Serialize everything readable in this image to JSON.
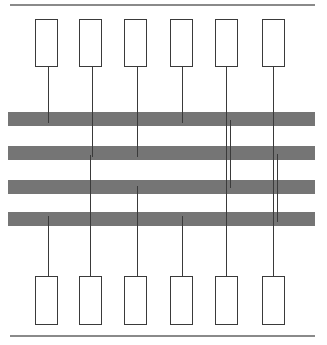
{
  "figure": {
    "title": "",
    "canvas": {
      "width": 327,
      "height": 345,
      "background": "#ffffff"
    },
    "colors": {
      "band": "#757575",
      "rule": "#8a8a8a",
      "box_stroke": "#3a3a3a",
      "line": "#3a3a3a",
      "background": "#ffffff"
    },
    "rules": [
      {
        "name": "top-rule",
        "x": 10,
        "y": 4,
        "width": 305,
        "height": 1.6
      },
      {
        "name": "bottom-rule",
        "x": 10,
        "y": 335,
        "width": 305,
        "height": 1.6
      }
    ],
    "bands": [
      {
        "name": "band-1",
        "index": 1,
        "x": 8,
        "y": 112,
        "width": 307,
        "height": 14
      },
      {
        "name": "band-2",
        "index": 2,
        "x": 8,
        "y": 146,
        "width": 307,
        "height": 14
      },
      {
        "name": "band-3",
        "index": 3,
        "x": 8,
        "y": 180,
        "width": 307,
        "height": 14
      },
      {
        "name": "band-4",
        "index": 4,
        "x": 8,
        "y": 212,
        "width": 307,
        "height": 14
      }
    ],
    "top_boxes": [
      {
        "name": "top-box-1",
        "index": 1,
        "label": "",
        "x": 35,
        "y": 19,
        "width": 23,
        "height": 48
      },
      {
        "name": "top-box-2",
        "index": 2,
        "label": "",
        "x": 79,
        "y": 19,
        "width": 23,
        "height": 48
      },
      {
        "name": "top-box-3",
        "index": 3,
        "label": "",
        "x": 124,
        "y": 19,
        "width": 23,
        "height": 48
      },
      {
        "name": "top-box-4",
        "index": 4,
        "label": "",
        "x": 170,
        "y": 19,
        "width": 23,
        "height": 48
      },
      {
        "name": "top-box-5",
        "index": 5,
        "label": "",
        "x": 215,
        "y": 19,
        "width": 23,
        "height": 48
      },
      {
        "name": "top-box-6",
        "index": 6,
        "label": "",
        "x": 262,
        "y": 19,
        "width": 23,
        "height": 48
      }
    ],
    "bottom_boxes": [
      {
        "name": "bottom-box-1",
        "index": 1,
        "label": "",
        "x": 35,
        "y": 276,
        "width": 23,
        "height": 49
      },
      {
        "name": "bottom-box-2",
        "index": 2,
        "label": "",
        "x": 79,
        "y": 276,
        "width": 23,
        "height": 49
      },
      {
        "name": "bottom-box-3",
        "index": 3,
        "label": "",
        "x": 124,
        "y": 276,
        "width": 23,
        "height": 49
      },
      {
        "name": "bottom-box-4",
        "index": 4,
        "label": "",
        "x": 170,
        "y": 276,
        "width": 23,
        "height": 49
      },
      {
        "name": "bottom-box-5",
        "index": 5,
        "label": "",
        "x": 215,
        "y": 276,
        "width": 23,
        "height": 49
      },
      {
        "name": "bottom-box-6",
        "index": 6,
        "label": "",
        "x": 262,
        "y": 276,
        "width": 23,
        "height": 49
      }
    ],
    "links": [
      {
        "name": "link-top-1",
        "column": 1,
        "x": 48,
        "y": 67,
        "height": 56
      },
      {
        "name": "link-bottom-1",
        "column": 1,
        "x": 48,
        "y": 216,
        "height": 60
      },
      {
        "name": "link-top-2",
        "column": 2,
        "x": 92,
        "y": 67,
        "height": 90
      },
      {
        "name": "link-stub-2",
        "column": 2,
        "x": 90,
        "y": 155,
        "height": 33
      },
      {
        "name": "link-bottom-2",
        "column": 2,
        "x": 90,
        "y": 186,
        "height": 90
      },
      {
        "name": "link-top-3",
        "column": 3,
        "x": 137,
        "y": 67,
        "height": 90
      },
      {
        "name": "link-bottom-3",
        "column": 3,
        "x": 137,
        "y": 186,
        "height": 90
      },
      {
        "name": "link-top-4",
        "column": 4,
        "x": 182,
        "y": 67,
        "height": 56
      },
      {
        "name": "link-bottom-4",
        "column": 4,
        "x": 182,
        "y": 216,
        "height": 60
      },
      {
        "name": "link-through-5",
        "column": 5,
        "x": 226,
        "y": 67,
        "height": 209
      },
      {
        "name": "link-stub-5",
        "column": 5,
        "x": 230,
        "y": 120,
        "height": 68
      },
      {
        "name": "link-through-6",
        "column": 6,
        "x": 273,
        "y": 67,
        "height": 209
      },
      {
        "name": "link-stub-6",
        "column": 6,
        "x": 277,
        "y": 154,
        "height": 68
      }
    ]
  }
}
